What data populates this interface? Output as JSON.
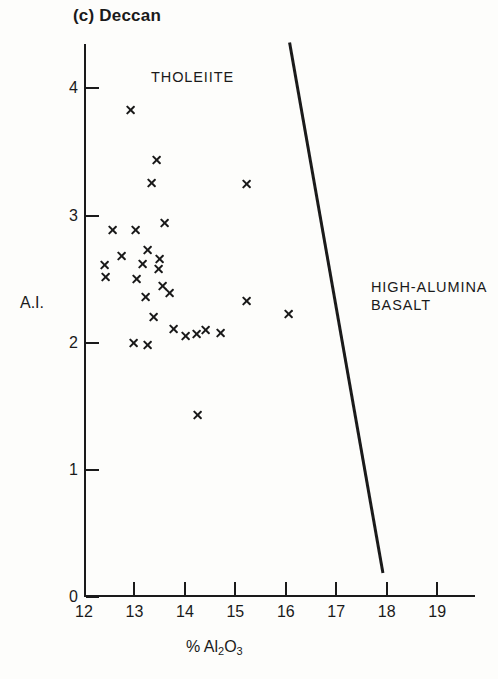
{
  "figure": {
    "panel_label": "(c) Deccan"
  },
  "chart_data": {
    "type": "scatter",
    "title": "(c) Deccan",
    "xlabel": "% Al2O3",
    "xlabel_parts": {
      "prefix": "% Al",
      "sub1": "2",
      "mid": "O",
      "sub2": "3"
    },
    "ylabel": "A.I.",
    "xlim": [
      12,
      19.75
    ],
    "ylim": [
      0,
      4.35
    ],
    "xticks": [
      12,
      13,
      14,
      15,
      16,
      17,
      18,
      19
    ],
    "xticklabels": [
      "12",
      "13",
      "14",
      "15",
      "16",
      "17",
      "18",
      "19"
    ],
    "yticks": [
      0,
      1,
      2,
      3,
      4
    ],
    "yticklabels": [
      "0",
      "1",
      "2",
      "3",
      "4"
    ],
    "grid": false,
    "legend": "none",
    "marker": "x",
    "marker_color": "#1a1a1a",
    "series": [
      {
        "name": "Deccan basalt analyses",
        "points": [
          [
            12.93,
            3.83
          ],
          [
            13.43,
            3.44
          ],
          [
            13.33,
            3.26
          ],
          [
            15.23,
            3.25
          ],
          [
            13.6,
            2.94
          ],
          [
            12.57,
            2.89
          ],
          [
            13.02,
            2.89
          ],
          [
            13.26,
            2.73
          ],
          [
            13.15,
            2.62
          ],
          [
            12.75,
            2.68
          ],
          [
            12.41,
            2.61
          ],
          [
            13.5,
            2.66
          ],
          [
            13.47,
            2.58
          ],
          [
            12.43,
            2.52
          ],
          [
            13.04,
            2.5
          ],
          [
            13.56,
            2.45
          ],
          [
            16.06,
            2.23
          ],
          [
            13.69,
            2.39
          ],
          [
            15.23,
            2.33
          ],
          [
            13.22,
            2.36
          ],
          [
            13.38,
            2.2
          ],
          [
            12.98,
            2.0
          ],
          [
            13.78,
            2.11
          ],
          [
            14.02,
            2.05
          ],
          [
            14.22,
            2.07
          ],
          [
            14.4,
            2.1
          ],
          [
            14.7,
            2.08
          ],
          [
            13.26,
            1.98
          ],
          [
            14.24,
            1.43
          ]
        ]
      }
    ],
    "annotations": [
      {
        "text": "THOLEIITE",
        "x": 13.3,
        "y": 4.05,
        "region": "upper-left"
      },
      {
        "text": "HIGH-ALUMINA\nBASALT",
        "x": 17.7,
        "y": 2.6,
        "region": "right"
      }
    ],
    "divider_line": {
      "label": "tholeiite / high-alumina basalt boundary",
      "x_start": 16.08,
      "y_start": 4.35,
      "x_end": 17.92,
      "y_end": 0.2,
      "color": "#1a1a1a",
      "width_px": 3
    }
  }
}
